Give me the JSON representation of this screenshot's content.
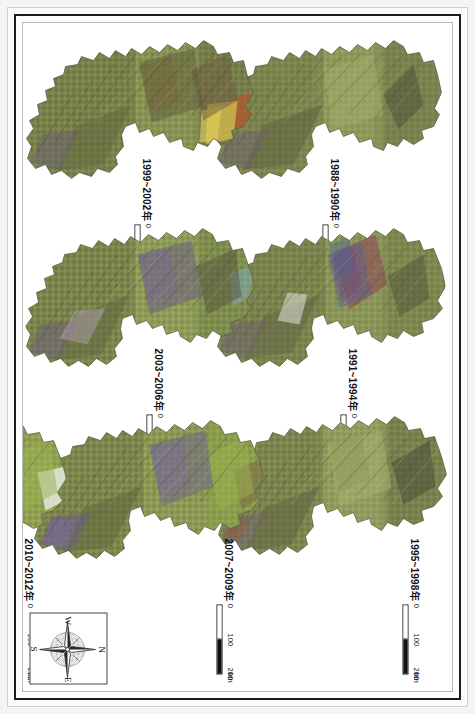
{
  "figure": {
    "kind": "multi-panel-remote-sensing-map-series",
    "orientation": "page rotated 90 degrees clockwise in screenshot",
    "background_color": "#ffffff",
    "frame_color": "#1c1c1c"
  },
  "panels": [
    {
      "id": "panel-1988-1990",
      "year_label": "1988~1990年",
      "scale": {
        "ticks": [
          "0",
          "100",
          "200"
        ],
        "unit": "km"
      },
      "dominant_colors": [
        "#7f8a4f",
        "#8b9455",
        "#6b6a4a",
        "#4e4f3c",
        "#9aa265"
      ]
    },
    {
      "id": "panel-1991-1994",
      "year_label": "1991~1994年",
      "scale": {
        "ticks": [
          "0",
          "100",
          "200"
        ],
        "unit": "km"
      },
      "dominant_colors": [
        "#7d8a4e",
        "#8e5a62",
        "#6a5a84",
        "#5b6a8e",
        "#96a163"
      ]
    },
    {
      "id": "panel-1995-1998",
      "year_label": "1995~1998年",
      "scale": {
        "ticks": [
          "0",
          "100",
          "200"
        ],
        "unit": "km"
      },
      "dominant_colors": [
        "#8a9457",
        "#6f7248",
        "#5a5a46",
        "#9fa86a",
        "#77683f"
      ]
    },
    {
      "id": "panel-1999-2002",
      "year_label": "1999~2002年",
      "scale": {
        "ticks": [
          "0",
          "100",
          "200"
        ],
        "unit": "km"
      },
      "dominant_colors": [
        "#7c8a4e",
        "#c9b34a",
        "#b66a3a",
        "#6f5b4c",
        "#8d9a5b"
      ]
    },
    {
      "id": "panel-2003-2006",
      "year_label": "2003~2006年",
      "scale": {
        "ticks": [
          "0",
          "100",
          "200"
        ],
        "unit": "km"
      },
      "dominant_colors": [
        "#7f9050",
        "#6c5d80",
        "#8d9a5b",
        "#5a5b45",
        "#a2ad6e"
      ]
    },
    {
      "id": "panel-2007-2009",
      "year_label": "2007~2009年",
      "scale": {
        "ticks": [
          "0",
          "100",
          "200"
        ],
        "unit": "km"
      },
      "dominant_colors": [
        "#83934f",
        "#6b5e86",
        "#9aa564",
        "#5d5f46",
        "#7c6c96"
      ]
    },
    {
      "id": "panel-2010-2012",
      "year_label": "2010~2012年",
      "scale": {
        "ticks": [
          "0",
          "100",
          "200"
        ],
        "unit": "km"
      },
      "dominant_colors": [
        "#87954f",
        "#e9eaea",
        "#6e6a50",
        "#9fa967",
        "#6e5f86"
      ]
    }
  ],
  "compass": {
    "north": "N",
    "east": "E",
    "south": "S",
    "west": "W"
  }
}
